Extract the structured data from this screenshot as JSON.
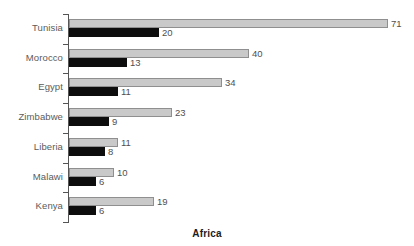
{
  "chart_data": {
    "type": "bar",
    "orientation": "horizontal",
    "title": "",
    "xlabel": "Africa",
    "ylabel": "",
    "grid": false,
    "legend": "none",
    "categories": [
      "Tunisia",
      "Morocco",
      "Egypt",
      "Zimbabwe",
      "Liberia",
      "Malawi",
      "Kenya"
    ],
    "xlim": [
      0,
      71
    ],
    "series": [
      {
        "name": "series-a",
        "color": "#c9c9c9",
        "values": [
          71,
          40,
          34,
          23,
          11,
          10,
          19
        ]
      },
      {
        "name": "series-b",
        "color": "#0d0d0d",
        "values": [
          20,
          13,
          11,
          9,
          8,
          6,
          6
        ]
      }
    ],
    "rows": [
      {
        "category": "Tunisia",
        "a": 71,
        "b": 20,
        "a_label": "71",
        "b_label": "20"
      },
      {
        "category": "Morocco",
        "a": 40,
        "b": 13,
        "a_label": "40",
        "b_label": "13"
      },
      {
        "category": "Egypt",
        "a": 34,
        "b": 11,
        "a_label": "34",
        "b_label": "11"
      },
      {
        "category": "Zimbabwe",
        "a": 23,
        "b": 9,
        "a_label": "23",
        "b_label": "9"
      },
      {
        "category": "Liberia",
        "a": 11,
        "b": 8,
        "a_label": "11",
        "b_label": "8"
      },
      {
        "category": "Malawi",
        "a": 10,
        "b": 6,
        "a_label": "10",
        "b_label": "6"
      },
      {
        "category": "Kenya",
        "a": 19,
        "b": 6,
        "a_label": "19",
        "b_label": "6"
      }
    ]
  },
  "caption": {
    "text": "Africa"
  },
  "axis": {
    "line_color": "#555555"
  }
}
